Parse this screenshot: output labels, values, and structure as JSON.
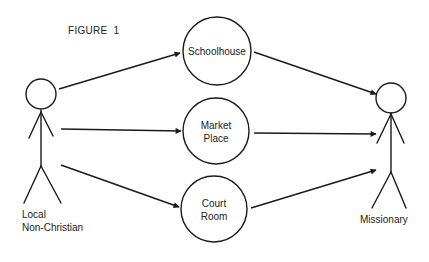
{
  "figure": {
    "title": "FIGURE",
    "number": "1"
  },
  "actors": {
    "left": {
      "label_line1": "Local",
      "label_line2": "Non-Christian"
    },
    "right": {
      "label": "Missionary"
    }
  },
  "nodes": [
    {
      "id": "schoolhouse",
      "line1": "Schoolhouse",
      "line2": ""
    },
    {
      "id": "market-place",
      "line1": "Market",
      "line2": "Place"
    },
    {
      "id": "court-room",
      "line1": "Court",
      "line2": "Room"
    }
  ],
  "edges": [
    {
      "from": "Local Non-Christian",
      "to": "Schoolhouse"
    },
    {
      "from": "Local Non-Christian",
      "to": "Market Place"
    },
    {
      "from": "Local Non-Christian",
      "to": "Court Room"
    },
    {
      "from": "Schoolhouse",
      "to": "Missionary"
    },
    {
      "from": "Market Place",
      "to": "Missionary"
    },
    {
      "from": "Court Room",
      "to": "Missionary"
    }
  ],
  "colors": {
    "stroke": "#1a1a1a",
    "background": "#ffffff"
  }
}
